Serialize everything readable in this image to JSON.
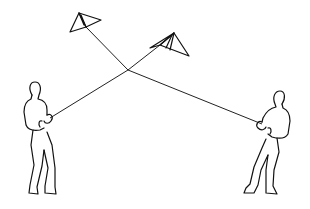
{
  "illustration": {
    "subject": "Two people flying kites with crossed strings",
    "kites": [
      {
        "name": "left-kite",
        "label": "Kite held by person on right"
      },
      {
        "name": "right-kite",
        "label": "Kite held by person on left"
      }
    ],
    "people": [
      {
        "name": "left-person",
        "label": "Person pulling kite string (left)"
      },
      {
        "name": "right-person",
        "label": "Person pulling kite string (right)"
      }
    ],
    "colors": {
      "line": "#111111",
      "background": "#ffffff"
    }
  }
}
